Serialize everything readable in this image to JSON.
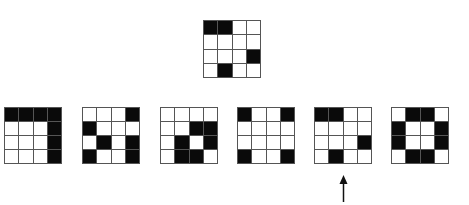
{
  "puzzle": {
    "grid_size": 4,
    "colors": {
      "filled": "#0a0a0a",
      "empty": "#ffffff",
      "line": "#555555"
    },
    "target": {
      "label": "reference pattern",
      "cells": [
        [
          1,
          1,
          0,
          0
        ],
        [
          0,
          0,
          0,
          0
        ],
        [
          0,
          0,
          0,
          1
        ],
        [
          0,
          1,
          0,
          0
        ]
      ]
    },
    "options": [
      {
        "index": 1,
        "cells": [
          [
            1,
            1,
            1,
            1
          ],
          [
            0,
            0,
            0,
            1
          ],
          [
            0,
            0,
            0,
            1
          ],
          [
            0,
            0,
            0,
            1
          ]
        ]
      },
      {
        "index": 2,
        "cells": [
          [
            0,
            0,
            0,
            1
          ],
          [
            1,
            0,
            0,
            0
          ],
          [
            0,
            1,
            0,
            1
          ],
          [
            1,
            0,
            0,
            1
          ]
        ]
      },
      {
        "index": 3,
        "cells": [
          [
            0,
            0,
            0,
            0
          ],
          [
            0,
            0,
            1,
            1
          ],
          [
            0,
            1,
            0,
            1
          ],
          [
            0,
            1,
            1,
            0
          ]
        ]
      },
      {
        "index": 4,
        "cells": [
          [
            1,
            0,
            0,
            1
          ],
          [
            0,
            0,
            0,
            0
          ],
          [
            0,
            0,
            0,
            0
          ],
          [
            1,
            0,
            0,
            1
          ]
        ]
      },
      {
        "index": 5,
        "cells": [
          [
            1,
            1,
            0,
            0
          ],
          [
            0,
            0,
            0,
            0
          ],
          [
            0,
            0,
            0,
            1
          ],
          [
            0,
            1,
            0,
            0
          ]
        ]
      },
      {
        "index": 6,
        "cells": [
          [
            0,
            1,
            1,
            0
          ],
          [
            1,
            0,
            0,
            1
          ],
          [
            1,
            0,
            0,
            1
          ],
          [
            0,
            1,
            1,
            0
          ]
        ]
      }
    ],
    "selected_option": 5,
    "indicator": "up-arrow"
  }
}
